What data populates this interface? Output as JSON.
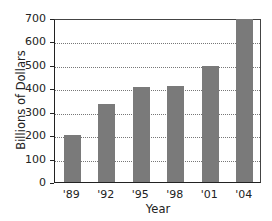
{
  "chart_data": {
    "type": "bar",
    "title": "",
    "xlabel": "Year",
    "ylabel": "Billions of Dollars",
    "categories": [
      "'89",
      "'92",
      "'95",
      "'98",
      "'01",
      "'04"
    ],
    "values": [
      200,
      335,
      405,
      410,
      495,
      695
    ],
    "ylim": [
      0,
      700
    ],
    "yticks": [
      0,
      100,
      200,
      300,
      400,
      500,
      600,
      700
    ],
    "grid": true,
    "bar_color": "#7a7a7a"
  },
  "labels": {
    "xlabel": "Year",
    "ylabel": "Billions of Dollars"
  }
}
